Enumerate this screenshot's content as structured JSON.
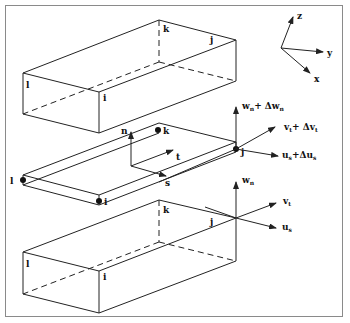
{
  "figure": {
    "top_box": {
      "nodes": {
        "i": "i",
        "j": "j",
        "k": "k",
        "l": "l"
      }
    },
    "middle_interface": {
      "nodes": {
        "i": "i",
        "j": "j",
        "k": "k",
        "l": "l"
      },
      "local_axes": {
        "n": "n",
        "t": "t",
        "s": "s"
      },
      "displacements_top": {
        "w": "w",
        "w_sub": "n",
        "w_plus": "+ Δw",
        "w_plus_sub": "n",
        "v": "v",
        "v_sub": "t",
        "v_plus": "+ Δv",
        "v_plus_sub": "t",
        "u": "u",
        "u_sub": "s",
        "u_plus": "+Δu",
        "u_plus_sub": "s"
      }
    },
    "bottom_box": {
      "nodes": {
        "i": "i",
        "j": "j",
        "k": "k",
        "l": "l"
      },
      "displacements": {
        "w": "w",
        "w_sub": "n",
        "v": "v",
        "v_sub": "t",
        "u": "u",
        "u_sub": "s"
      }
    },
    "global_axes": {
      "x": "x",
      "y": "y",
      "z": "z"
    }
  },
  "colors": {
    "line": "#222222",
    "frame": "#8a8a8a",
    "background": "#ffffff"
  }
}
